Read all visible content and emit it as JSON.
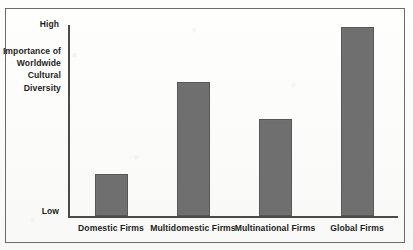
{
  "chart_data": {
    "type": "bar",
    "title": "",
    "subtitle": "",
    "xlabel": "",
    "ylabel": "Importance of Worldwide Cultural Diversity",
    "ylabel_lines": [
      "Importance of",
      "Worldwide",
      "Cultural",
      "Diversity"
    ],
    "categories": [
      "Domestic Firms",
      "Multidomestic Firms",
      "Multinational Firms",
      "Global Firms"
    ],
    "values": [
      22,
      70,
      51,
      99
    ],
    "ylim": [
      0,
      100
    ],
    "ytick_labels": [
      "High",
      "Low"
    ],
    "ytick_values": [
      100,
      0
    ],
    "grid": false,
    "legend": null,
    "annotations": [],
    "series": [
      {
        "name": "Importance of Worldwide Cultural Diversity",
        "values": [
          22,
          70,
          51,
          99
        ]
      }
    ]
  },
  "style": {
    "bar_fill": "#6f6f6f",
    "bar_border": "#565656",
    "axis_color": "#4a4a4a",
    "frame_color": "#6b6b6b",
    "text_color": "#1d1d1d",
    "background": "#fdfdfc"
  }
}
